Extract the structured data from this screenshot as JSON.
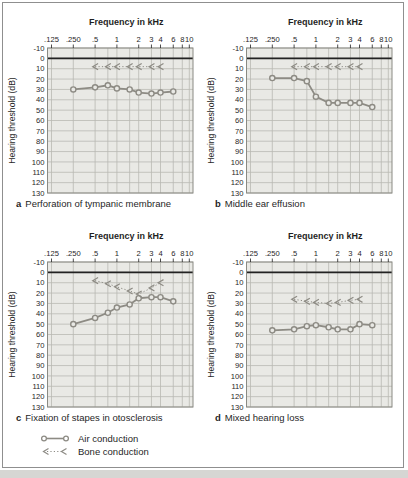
{
  "figure": {
    "kind": "four-panel audiogram figure",
    "panels_count": 4
  },
  "colors": {
    "curve": "#8d8b84",
    "plot_bg": "#e9e9e5",
    "grid": "#b9b9b2",
    "zero_line": "#222222",
    "plot_border": "#8a8a83",
    "frame_border": "#8f8f8f",
    "text": "#1f1f1f",
    "page_strip": "#d6d6d3"
  },
  "legend": {
    "items": [
      {
        "label": "Air conduction",
        "marker": "circle-solid-line"
      },
      {
        "label": "Bone conduction",
        "marker": "left-chevron-dotted-line"
      }
    ]
  },
  "chart_data": [
    {
      "type": "line",
      "panel_letter": "a",
      "caption": "Perforation of tympanic membrane",
      "xlabel": "Frequency in kHz",
      "ylabel": "Hearing threshold (dB)",
      "x_scale": "log",
      "x_tick_labels": [
        ".125",
        ".250",
        ".5",
        "1",
        "2",
        "3",
        "4",
        "6",
        "8",
        "10"
      ],
      "x_tick_freqs": [
        0.125,
        0.25,
        0.5,
        1,
        2,
        3,
        4,
        6,
        8,
        10
      ],
      "grid_freqs": [
        0.125,
        0.25,
        0.5,
        0.75,
        1,
        1.5,
        2,
        3,
        4,
        6,
        8,
        10
      ],
      "ylim": [
        -10,
        130
      ],
      "y_step": 10,
      "y_axis_inverted_downward": true,
      "series": [
        {
          "name": "Air conduction",
          "marker": "circle",
          "style": "solid",
          "x": [
            0.25,
            0.5,
            0.75,
            1,
            1.5,
            2,
            3,
            4,
            6
          ],
          "values": [
            30,
            28,
            26,
            29,
            30,
            33,
            34,
            33,
            32
          ]
        },
        {
          "name": "Bone conduction",
          "marker": "left-chevron",
          "style": "dotted",
          "x": [
            0.5,
            0.75,
            1,
            1.5,
            2,
            3,
            4
          ],
          "values": [
            8,
            8,
            8,
            8,
            8,
            8,
            8
          ]
        }
      ]
    },
    {
      "type": "line",
      "panel_letter": "b",
      "caption": "Middle ear effusion",
      "xlabel": "Frequency in kHz",
      "ylabel": "Hearing threshold (dB)",
      "x_scale": "log",
      "x_tick_labels": [
        ".125",
        ".250",
        ".5",
        "1",
        "2",
        "3",
        "4",
        "6",
        "8",
        "10"
      ],
      "x_tick_freqs": [
        0.125,
        0.25,
        0.5,
        1,
        2,
        3,
        4,
        6,
        8,
        10
      ],
      "grid_freqs": [
        0.125,
        0.25,
        0.5,
        0.75,
        1,
        1.5,
        2,
        3,
        4,
        6,
        8,
        10
      ],
      "ylim": [
        -10,
        130
      ],
      "y_step": 10,
      "y_axis_inverted_downward": true,
      "series": [
        {
          "name": "Air conduction",
          "marker": "circle",
          "style": "solid",
          "x": [
            0.25,
            0.5,
            0.75,
            1,
            1.5,
            2,
            3,
            4,
            6
          ],
          "values": [
            19,
            19,
            22,
            37,
            43,
            43,
            43,
            43,
            47
          ]
        },
        {
          "name": "Bone conduction",
          "marker": "left-chevron",
          "style": "dotted",
          "x": [
            0.5,
            0.75,
            1,
            1.5,
            2,
            3,
            4
          ],
          "values": [
            8,
            8,
            8,
            8,
            8,
            8,
            8
          ]
        }
      ]
    },
    {
      "type": "line",
      "panel_letter": "c",
      "caption": "Fixation of stapes in otosclerosis",
      "xlabel": "Frequency in kHz",
      "ylabel": "Hearing threshold (dB)",
      "x_scale": "log",
      "x_tick_labels": [
        ".125",
        ".250",
        ".5",
        "1",
        "2",
        "3",
        "4",
        "6",
        "8",
        "10"
      ],
      "x_tick_freqs": [
        0.125,
        0.25,
        0.5,
        1,
        2,
        3,
        4,
        6,
        8,
        10
      ],
      "grid_freqs": [
        0.125,
        0.25,
        0.5,
        0.75,
        1,
        1.5,
        2,
        3,
        4,
        6,
        8,
        10
      ],
      "ylim": [
        -10,
        130
      ],
      "y_step": 10,
      "y_axis_inverted_downward": true,
      "series": [
        {
          "name": "Air conduction",
          "marker": "circle",
          "style": "solid",
          "x": [
            0.25,
            0.5,
            0.75,
            1,
            1.5,
            2,
            3,
            4,
            6
          ],
          "values": [
            50,
            44,
            39,
            34,
            31,
            25,
            24,
            24,
            28
          ]
        },
        {
          "name": "Bone conduction",
          "marker": "left-chevron",
          "style": "dotted",
          "x": [
            0.5,
            0.75,
            1,
            1.5,
            2,
            3,
            4
          ],
          "values": [
            8,
            11,
            14,
            18,
            21,
            15,
            10
          ]
        }
      ]
    },
    {
      "type": "line",
      "panel_letter": "d",
      "caption": "Mixed hearing loss",
      "xlabel": "Frequency in kHz",
      "ylabel": "Hearing threshold (dB)",
      "x_scale": "log",
      "x_tick_labels": [
        ".125",
        ".250",
        ".5",
        "1",
        "2",
        "3",
        "4",
        "6",
        "8",
        "10"
      ],
      "x_tick_freqs": [
        0.125,
        0.25,
        0.5,
        1,
        2,
        3,
        4,
        6,
        8,
        10
      ],
      "grid_freqs": [
        0.125,
        0.25,
        0.5,
        0.75,
        1,
        1.5,
        2,
        3,
        4,
        6,
        8,
        10
      ],
      "ylim": [
        -10,
        130
      ],
      "y_step": 10,
      "y_axis_inverted_downward": true,
      "series": [
        {
          "name": "Air conduction",
          "marker": "circle",
          "style": "solid",
          "x": [
            0.25,
            0.5,
            0.75,
            1,
            1.5,
            2,
            3,
            4,
            6
          ],
          "values": [
            56,
            55,
            52,
            51,
            53,
            55,
            55,
            50,
            51
          ]
        },
        {
          "name": "Bone conduction",
          "marker": "left-chevron",
          "style": "dotted",
          "x": [
            0.5,
            0.75,
            1,
            1.5,
            2,
            3,
            4
          ],
          "values": [
            26,
            28,
            29,
            30,
            29,
            27,
            26
          ]
        }
      ]
    }
  ]
}
